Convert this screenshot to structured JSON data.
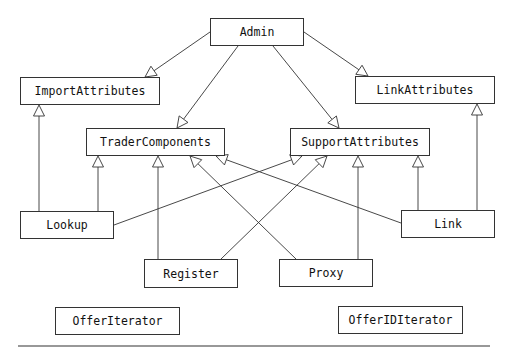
{
  "diagram": {
    "type": "class-inheritance",
    "nodes": [
      {
        "id": "admin",
        "label": "Admin",
        "x": 210,
        "y": 18,
        "w": 94,
        "h": 28
      },
      {
        "id": "import_attributes",
        "label": "ImportAttributes",
        "x": 20,
        "y": 77,
        "w": 140,
        "h": 28
      },
      {
        "id": "link_attributes",
        "label": "LinkAttributes",
        "x": 355,
        "y": 76,
        "w": 140,
        "h": 28
      },
      {
        "id": "trader_components",
        "label": "TraderComponents",
        "x": 86,
        "y": 128,
        "w": 139,
        "h": 28
      },
      {
        "id": "support_attributes",
        "label": "SupportAttributes",
        "x": 290,
        "y": 128,
        "w": 140,
        "h": 28
      },
      {
        "id": "lookup",
        "label": "Lookup",
        "x": 20,
        "y": 211,
        "w": 94,
        "h": 28
      },
      {
        "id": "link",
        "label": "Link",
        "x": 401,
        "y": 210,
        "w": 94,
        "h": 28
      },
      {
        "id": "register",
        "label": "Register",
        "x": 144,
        "y": 259,
        "w": 94,
        "h": 29
      },
      {
        "id": "proxy",
        "label": "Proxy",
        "x": 279,
        "y": 259,
        "w": 94,
        "h": 28
      },
      {
        "id": "offer_iterator",
        "label": "OfferIterator",
        "x": 55,
        "y": 307,
        "w": 125,
        "h": 28
      },
      {
        "id": "offer_id_iterator",
        "label": "OfferIDIterator",
        "x": 338,
        "y": 306,
        "w": 125,
        "h": 28
      }
    ],
    "edges": [
      {
        "from": "admin",
        "to": "import_attributes",
        "x1": 210,
        "y1": 32,
        "x2": 145,
        "y2": 77
      },
      {
        "from": "admin",
        "to": "trader_components",
        "x1": 238,
        "y1": 46,
        "x2": 177,
        "y2": 128
      },
      {
        "from": "admin",
        "to": "support_attributes",
        "x1": 273,
        "y1": 46,
        "x2": 339,
        "y2": 128
      },
      {
        "from": "admin",
        "to": "link_attributes",
        "x1": 304,
        "y1": 32,
        "x2": 368,
        "y2": 76
      },
      {
        "from": "lookup",
        "to": "import_attributes",
        "x1": 39,
        "y1": 211,
        "x2": 39,
        "y2": 105
      },
      {
        "from": "lookup",
        "to": "trader_components",
        "x1": 98,
        "y1": 211,
        "x2": 98,
        "y2": 156
      },
      {
        "from": "lookup",
        "to": "support_attributes",
        "x1": 114,
        "y1": 225,
        "x2": 302,
        "y2": 156
      },
      {
        "from": "register",
        "to": "trader_components",
        "x1": 158,
        "y1": 259,
        "x2": 158,
        "y2": 156
      },
      {
        "from": "register",
        "to": "support_attributes",
        "x1": 221,
        "y1": 259,
        "x2": 327,
        "y2": 156
      },
      {
        "from": "proxy",
        "to": "trader_components",
        "x1": 296,
        "y1": 259,
        "x2": 190,
        "y2": 156
      },
      {
        "from": "proxy",
        "to": "support_attributes",
        "x1": 358,
        "y1": 259,
        "x2": 358,
        "y2": 156
      },
      {
        "from": "link",
        "to": "trader_components",
        "x1": 401,
        "y1": 223,
        "x2": 216,
        "y2": 156
      },
      {
        "from": "link",
        "to": "support_attributes",
        "x1": 418,
        "y1": 210,
        "x2": 418,
        "y2": 156
      },
      {
        "from": "link",
        "to": "link_attributes",
        "x1": 477,
        "y1": 210,
        "x2": 477,
        "y2": 104
      }
    ],
    "separator": {
      "x1": 18,
      "y1": 346,
      "x2": 490,
      "y2": 346
    },
    "colors": {
      "stroke": "#333333",
      "text": "#111111",
      "background": "#ffffff"
    }
  }
}
